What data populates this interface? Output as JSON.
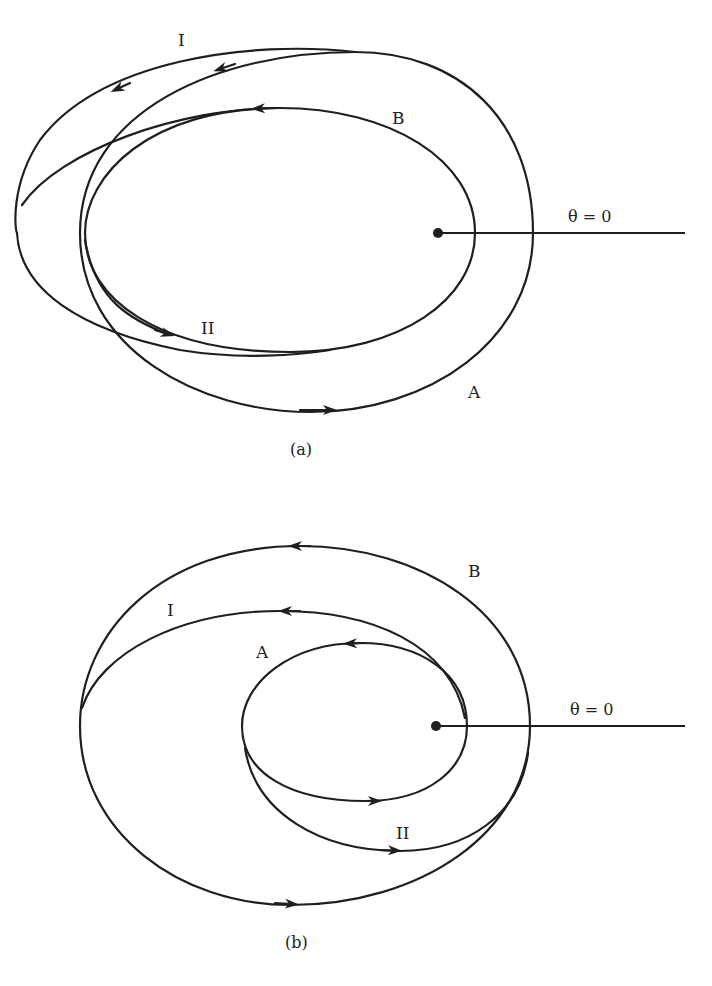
{
  "figures": [
    {
      "id": "a",
      "caption": "(a)",
      "axis_label": "θ = 0",
      "curve_labels": {
        "I": "I",
        "II": "II",
        "A": "A",
        "B": "B"
      }
    },
    {
      "id": "b",
      "caption": "(b)",
      "axis_label": "θ = 0",
      "curve_labels": {
        "I": "I",
        "II": "II",
        "A": "A",
        "B": "B"
      }
    }
  ],
  "colors": {
    "stroke": "#1f1f1f",
    "background": "#ffffff"
  }
}
